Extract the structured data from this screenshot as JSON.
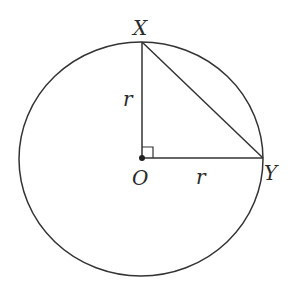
{
  "diagram": {
    "type": "circle-geometry",
    "points": {
      "center": {
        "label": "O",
        "x": 142,
        "y": 158
      },
      "top": {
        "label": "X",
        "x": 142,
        "y": 42
      },
      "right": {
        "label": "Y",
        "x": 263,
        "y": 158
      }
    },
    "segment_labels": {
      "OX": "r",
      "OY": "r"
    },
    "circle": {
      "cx": 141,
      "cy": 159,
      "rx": 122,
      "ry": 117
    },
    "right_angle_marker": true,
    "stroke_color": "#333333"
  }
}
